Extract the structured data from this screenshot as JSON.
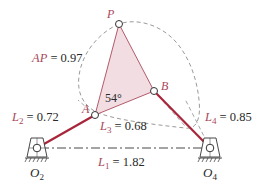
{
  "figure": {
    "type": "four-bar linkage with coupler curve",
    "colors": {
      "link": "#a8253a",
      "coupler_fill": "#f1dde2",
      "coupler_edge": "#b45a6c",
      "label_accent": "#a8475a",
      "dashed": "#9a9a9a",
      "text": "#2a2a2a"
    },
    "points": {
      "P": {
        "label": "P",
        "x": 119,
        "y": 24
      },
      "A": {
        "label": "A",
        "x": 95,
        "y": 115
      },
      "B": {
        "label": "B",
        "x": 154,
        "y": 91
      },
      "O2": {
        "label": "O",
        "sub": "2",
        "x": 37,
        "y": 148
      },
      "O4": {
        "label": "O",
        "sub": "4",
        "x": 210,
        "y": 148
      }
    },
    "labels": {
      "AP": {
        "sym": "AP",
        "eq": " = 0.97"
      },
      "L1": {
        "sym": "L",
        "sub": "1",
        "eq": " = 1.82"
      },
      "L2": {
        "sym": "L",
        "sub": "2",
        "eq": " = 0.72"
      },
      "L3": {
        "sym": "L",
        "sub": "3",
        "eq": " = 0.68"
      },
      "L4": {
        "sym": "L",
        "sub": "4",
        "eq": " = 0.85"
      }
    },
    "angle": "54°"
  }
}
